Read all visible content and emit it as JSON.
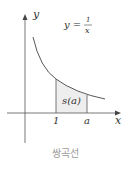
{
  "figure": {
    "equation_lhs": "y =",
    "equation_num": "1",
    "equation_den": "x",
    "y_axis_label": "y",
    "x_axis_label": "x",
    "tick_1": "1",
    "tick_a": "a",
    "area_label": "s(a)",
    "caption": "쌍곡선",
    "colors": {
      "axis": "#555555",
      "curve": "#444444",
      "shade": "#eeeeee",
      "caption": "#9a9a9a"
    }
  }
}
